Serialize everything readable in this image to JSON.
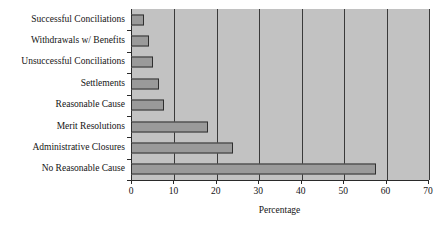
{
  "chart_data": {
    "type": "bar",
    "orientation": "horizontal",
    "title": "",
    "xlabel": "Percentage",
    "ylabel": "",
    "xlim": [
      0,
      70
    ],
    "xticks": [
      0,
      10,
      20,
      30,
      40,
      50,
      60,
      70
    ],
    "grid": true,
    "grid_axis": "x",
    "legend": false,
    "categories": [
      "Successful Conciliations",
      "Withdrawals w/ Benefits",
      "Unsuccessful Conciliations",
      "Settlements",
      "Reasonable Cause",
      "Merit Resolutions",
      "Administrative Closures",
      "No Reasonable Cause"
    ],
    "values": [
      3,
      4.2,
      5.2,
      6.6,
      7.8,
      18.2,
      24,
      57.8
    ],
    "colors": {
      "plot_background": "#c2c2c2",
      "bar_fill": "#9a9a9a",
      "bar_edge": "#2e2e2e",
      "axis": "#2a2a2a",
      "grid": "#3a3a3a",
      "text": "#141414",
      "page_background": "#ffffff"
    }
  }
}
